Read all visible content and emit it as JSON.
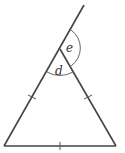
{
  "diagram": {
    "type": "isosceles-triangle-exterior-angle",
    "labels": {
      "interior_angle": "d",
      "exterior_angle": "e"
    },
    "equal_sides_marks": 3,
    "colors": {
      "stroke": "#444444",
      "background": "#ffffff"
    }
  }
}
